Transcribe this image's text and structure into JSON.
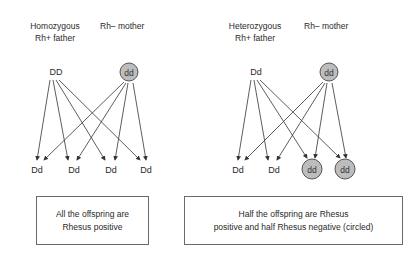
{
  "left": {
    "father_label_line1": "Homozygous",
    "father_label_line2": "Rh+ father",
    "mother_label": "Rh– mother",
    "father_genotype": "DD",
    "mother_genotype": "dd",
    "offspring": [
      "Dd",
      "Dd",
      "Dd",
      "Dd"
    ],
    "offspring_circled": [
      false,
      false,
      false,
      false
    ],
    "caption_line1": "All the offspring are",
    "caption_line2": "Rhesus positive"
  },
  "right": {
    "father_label_line1": "Heterozygous",
    "father_label_line2": "Rh+ father",
    "mother_label": "Rh– mother",
    "father_genotype": "Dd",
    "mother_genotype": "dd",
    "offspring": [
      "Dd",
      "Dd",
      "dd",
      "dd"
    ],
    "offspring_circled": [
      false,
      false,
      true,
      true
    ],
    "caption_line1": "Half the offspring are Rhesus",
    "caption_line2": "positive and half Rhesus negative (circled)"
  },
  "colors": {
    "circle_fill": "#bdbdbd",
    "line": "#333333",
    "box_border": "#6a6a6a"
  }
}
